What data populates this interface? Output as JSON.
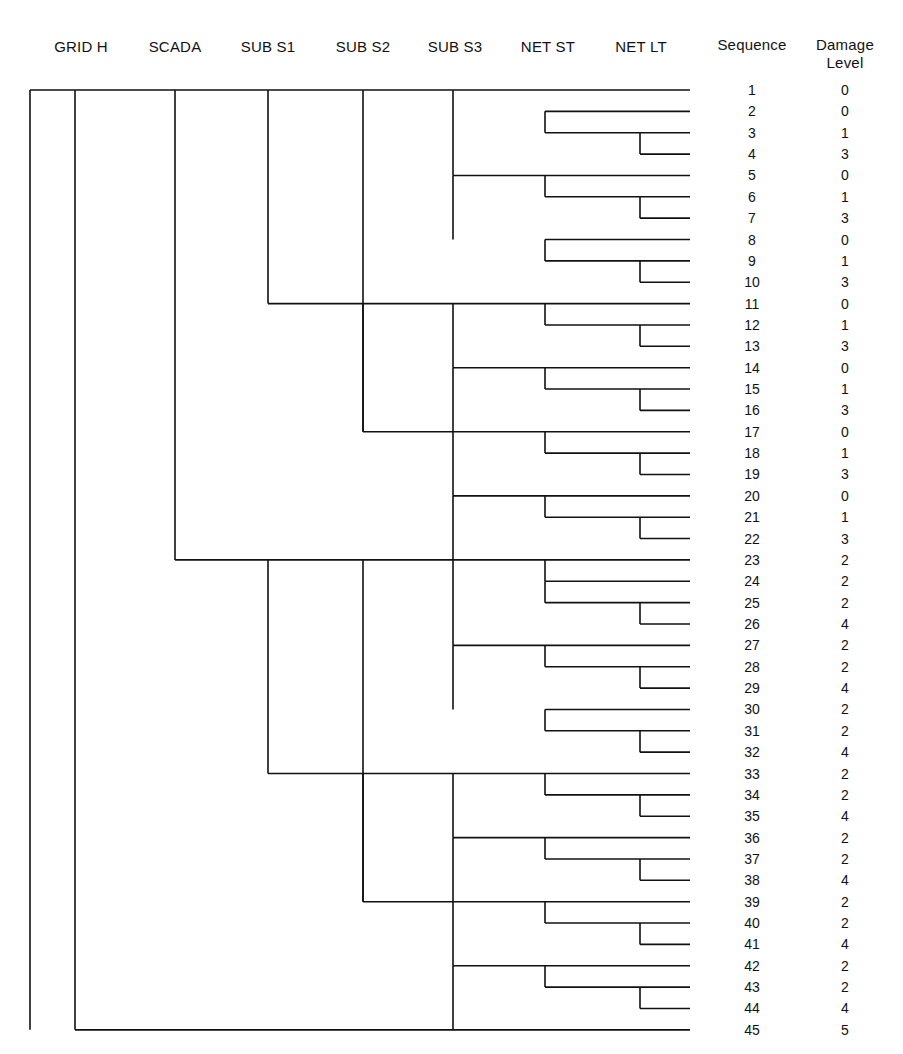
{
  "figure": {
    "type": "dendrogram",
    "leaf_line_end_x": 690,
    "background_color": "#ffffff",
    "line_color": "#111111"
  },
  "headers": {
    "tree_levels": [
      {
        "label": "GRID H",
        "x": 81,
        "axis_x": 75
      },
      {
        "label": "SCADA",
        "x": 175,
        "axis_x": 175
      },
      {
        "label": "SUB S1",
        "x": 268,
        "axis_x": 268
      },
      {
        "label": "SUB S2",
        "x": 363,
        "axis_x": 363
      },
      {
        "label": "SUB S3",
        "x": 455,
        "axis_x": 453
      },
      {
        "label": "NET ST",
        "x": 548,
        "axis_x": 545
      },
      {
        "label": "NET LT",
        "x": 641,
        "axis_x": 640
      }
    ],
    "sequence_column": {
      "label": "Sequence",
      "x": 752
    },
    "damage_column": {
      "label_line1": "Damage",
      "label_line2": "Level",
      "x": 845
    }
  },
  "table": {
    "columns": [
      "Sequence",
      "Damage Level"
    ],
    "rows": [
      {
        "sequence": "1",
        "damage": "0"
      },
      {
        "sequence": "2",
        "damage": "0"
      },
      {
        "sequence": "3",
        "damage": "1"
      },
      {
        "sequence": "4",
        "damage": "3"
      },
      {
        "sequence": "5",
        "damage": "0"
      },
      {
        "sequence": "6",
        "damage": "1"
      },
      {
        "sequence": "7",
        "damage": "3"
      },
      {
        "sequence": "8",
        "damage": "0"
      },
      {
        "sequence": "9",
        "damage": "1"
      },
      {
        "sequence": "10",
        "damage": "3"
      },
      {
        "sequence": "11",
        "damage": "0"
      },
      {
        "sequence": "12",
        "damage": "1"
      },
      {
        "sequence": "13",
        "damage": "3"
      },
      {
        "sequence": "14",
        "damage": "0"
      },
      {
        "sequence": "15",
        "damage": "1"
      },
      {
        "sequence": "16",
        "damage": "3"
      },
      {
        "sequence": "17",
        "damage": "0"
      },
      {
        "sequence": "18",
        "damage": "1"
      },
      {
        "sequence": "19",
        "damage": "3"
      },
      {
        "sequence": "20",
        "damage": "0"
      },
      {
        "sequence": "21",
        "damage": "1"
      },
      {
        "sequence": "22",
        "damage": "3"
      },
      {
        "sequence": "23",
        "damage": "2"
      },
      {
        "sequence": "24",
        "damage": "2"
      },
      {
        "sequence": "25",
        "damage": "2"
      },
      {
        "sequence": "26",
        "damage": "4"
      },
      {
        "sequence": "27",
        "damage": "2"
      },
      {
        "sequence": "28",
        "damage": "2"
      },
      {
        "sequence": "29",
        "damage": "4"
      },
      {
        "sequence": "30",
        "damage": "2"
      },
      {
        "sequence": "31",
        "damage": "2"
      },
      {
        "sequence": "32",
        "damage": "4"
      },
      {
        "sequence": "33",
        "damage": "2"
      },
      {
        "sequence": "34",
        "damage": "2"
      },
      {
        "sequence": "35",
        "damage": "4"
      },
      {
        "sequence": "36",
        "damage": "2"
      },
      {
        "sequence": "37",
        "damage": "2"
      },
      {
        "sequence": "38",
        "damage": "4"
      },
      {
        "sequence": "39",
        "damage": "2"
      },
      {
        "sequence": "40",
        "damage": "2"
      },
      {
        "sequence": "41",
        "damage": "4"
      },
      {
        "sequence": "42",
        "damage": "2"
      },
      {
        "sequence": "43",
        "damage": "2"
      },
      {
        "sequence": "44",
        "damage": "4"
      },
      {
        "sequence": "45",
        "damage": "5"
      }
    ]
  },
  "chart_data": {
    "type": "tree",
    "title": "",
    "leaf_rows": {
      "first_y": 90,
      "spacing": 21.36,
      "count": 45
    },
    "branch_x": {
      "root": 30,
      "grid_h": 75,
      "scada": 175,
      "sub_s1": 268,
      "sub_s2": 363,
      "sub_s3": 453,
      "net_st": 545,
      "net_lt": 640,
      "leaf_end": 690
    },
    "horizontal_segments": [
      {
        "y_row": 1,
        "x1": 30,
        "x2": 690
      },
      {
        "y_row": 2,
        "x1": 545,
        "x2": 690
      },
      {
        "y_row": 3,
        "x1": 545,
        "x2": 690
      },
      {
        "y_row": 4,
        "x1": 640,
        "x2": 690
      },
      {
        "y_row": 5,
        "x1": 453,
        "x2": 690
      },
      {
        "y_row": 6,
        "x1": 545,
        "x2": 690
      },
      {
        "y_row": 7,
        "x1": 640,
        "x2": 690
      },
      {
        "y_row": 8,
        "x1": 545,
        "x2": 690
      },
      {
        "y_row": 9,
        "x1": 545,
        "x2": 690
      },
      {
        "y_row": 10,
        "x1": 640,
        "x2": 690
      },
      {
        "y_row": 11,
        "x1": 268,
        "x2": 690
      },
      {
        "y_row": 12,
        "x1": 545,
        "x2": 690
      },
      {
        "y_row": 13,
        "x1": 640,
        "x2": 690
      },
      {
        "y_row": 14,
        "x1": 453,
        "x2": 690
      },
      {
        "y_row": 15,
        "x1": 545,
        "x2": 690
      },
      {
        "y_row": 16,
        "x1": 640,
        "x2": 690
      },
      {
        "y_row": 17,
        "x1": 363,
        "x2": 690
      },
      {
        "y_row": 18,
        "x1": 545,
        "x2": 690
      },
      {
        "y_row": 19,
        "x1": 640,
        "x2": 690
      },
      {
        "y_row": 20,
        "x1": 453,
        "x2": 690
      },
      {
        "y_row": 21,
        "x1": 545,
        "x2": 690
      },
      {
        "y_row": 22,
        "x1": 640,
        "x2": 690
      },
      {
        "y_row": 23,
        "x1": 175,
        "x2": 690
      },
      {
        "y_row": 24,
        "x1": 545,
        "x2": 690
      },
      {
        "y_row": 25,
        "x1": 545,
        "x2": 690
      },
      {
        "y_row": 26,
        "x1": 640,
        "x2": 690
      },
      {
        "y_row": 27,
        "x1": 453,
        "x2": 690
      },
      {
        "y_row": 28,
        "x1": 545,
        "x2": 690
      },
      {
        "y_row": 29,
        "x1": 640,
        "x2": 690
      },
      {
        "y_row": 30,
        "x1": 545,
        "x2": 690
      },
      {
        "y_row": 31,
        "x1": 545,
        "x2": 690
      },
      {
        "y_row": 32,
        "x1": 640,
        "x2": 690
      },
      {
        "y_row": 33,
        "x1": 268,
        "x2": 690
      },
      {
        "y_row": 34,
        "x1": 545,
        "x2": 690
      },
      {
        "y_row": 35,
        "x1": 640,
        "x2": 690
      },
      {
        "y_row": 36,
        "x1": 453,
        "x2": 690
      },
      {
        "y_row": 37,
        "x1": 545,
        "x2": 690
      },
      {
        "y_row": 38,
        "x1": 640,
        "x2": 690
      },
      {
        "y_row": 39,
        "x1": 363,
        "x2": 690
      },
      {
        "y_row": 40,
        "x1": 545,
        "x2": 690
      },
      {
        "y_row": 41,
        "x1": 640,
        "x2": 690
      },
      {
        "y_row": 42,
        "x1": 453,
        "x2": 690
      },
      {
        "y_row": 43,
        "x1": 545,
        "x2": 690
      },
      {
        "y_row": 44,
        "x1": 640,
        "x2": 690
      },
      {
        "y_row": 45,
        "x1": 75,
        "x2": 690
      }
    ],
    "vertical_segments": [
      {
        "x": 30,
        "row1": 1,
        "row2": 45
      },
      {
        "x": 75,
        "row1": 1,
        "row2": 45
      },
      {
        "x": 175,
        "row1": 1,
        "row2": 23
      },
      {
        "x": 268,
        "row1": 1,
        "row2": 11
      },
      {
        "x": 268,
        "row1": 23,
        "row2": 33
      },
      {
        "x": 363,
        "row1": 1,
        "row2": 17
      },
      {
        "x": 363,
        "row1": 11,
        "row2": 17
      },
      {
        "x": 363,
        "row1": 23,
        "row2": 39
      },
      {
        "x": 363,
        "row1": 33,
        "row2": 39
      },
      {
        "x": 453,
        "row1": 1,
        "row2": 5
      },
      {
        "x": 453,
        "row1": 5,
        "row2": 8
      },
      {
        "x": 453,
        "row1": 11,
        "row2": 14
      },
      {
        "x": 453,
        "row1": 14,
        "row2": 17
      },
      {
        "x": 453,
        "row1": 17,
        "row2": 20
      },
      {
        "x": 453,
        "row1": 20,
        "row2": 23
      },
      {
        "x": 453,
        "row1": 23,
        "row2": 27
      },
      {
        "x": 453,
        "row1": 27,
        "row2": 30
      },
      {
        "x": 453,
        "row1": 33,
        "row2": 36
      },
      {
        "x": 453,
        "row1": 36,
        "row2": 39
      },
      {
        "x": 453,
        "row1": 39,
        "row2": 42
      },
      {
        "x": 453,
        "row1": 42,
        "row2": 45
      },
      {
        "x": 545,
        "row1": 2,
        "row2": 3
      },
      {
        "x": 545,
        "row1": 5,
        "row2": 6
      },
      {
        "x": 545,
        "row1": 8,
        "row2": 9
      },
      {
        "x": 545,
        "row1": 11,
        "row2": 12
      },
      {
        "x": 545,
        "row1": 14,
        "row2": 15
      },
      {
        "x": 545,
        "row1": 17,
        "row2": 18
      },
      {
        "x": 545,
        "row1": 20,
        "row2": 21
      },
      {
        "x": 545,
        "row1": 23,
        "row2": 24
      },
      {
        "x": 545,
        "row1": 24,
        "row2": 25
      },
      {
        "x": 545,
        "row1": 27,
        "row2": 28
      },
      {
        "x": 545,
        "row1": 30,
        "row2": 31
      },
      {
        "x": 545,
        "row1": 33,
        "row2": 34
      },
      {
        "x": 545,
        "row1": 36,
        "row2": 37
      },
      {
        "x": 545,
        "row1": 39,
        "row2": 40
      },
      {
        "x": 545,
        "row1": 42,
        "row2": 43
      },
      {
        "x": 640,
        "row1": 3,
        "row2": 4
      },
      {
        "x": 640,
        "row1": 6,
        "row2": 7
      },
      {
        "x": 640,
        "row1": 9,
        "row2": 10
      },
      {
        "x": 640,
        "row1": 12,
        "row2": 13
      },
      {
        "x": 640,
        "row1": 15,
        "row2": 16
      },
      {
        "x": 640,
        "row1": 18,
        "row2": 19
      },
      {
        "x": 640,
        "row1": 21,
        "row2": 22
      },
      {
        "x": 640,
        "row1": 25,
        "row2": 26
      },
      {
        "x": 640,
        "row1": 28,
        "row2": 29
      },
      {
        "x": 640,
        "row1": 31,
        "row2": 32
      },
      {
        "x": 640,
        "row1": 34,
        "row2": 35
      },
      {
        "x": 640,
        "row1": 37,
        "row2": 38
      },
      {
        "x": 640,
        "row1": 40,
        "row2": 41
      },
      {
        "x": 640,
        "row1": 43,
        "row2": 44
      }
    ]
  }
}
